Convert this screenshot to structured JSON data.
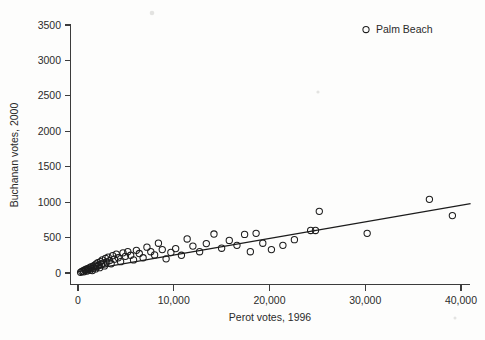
{
  "chart_data": {
    "type": "scatter",
    "title": "",
    "xlabel": "Perot votes, 1996",
    "ylabel": "Buchanan votes, 2000",
    "xlim": [
      -1500,
      42000
    ],
    "ylim": [
      -140,
      3650
    ],
    "xticks": [
      0,
      10000,
      20000,
      30000,
      40000
    ],
    "xticklabels": [
      "0",
      "10,000",
      "20,000",
      "30,000",
      "40,000"
    ],
    "yticks": [
      0,
      500,
      1000,
      1500,
      2000,
      2500,
      3000,
      3500
    ],
    "yticklabels": [
      "0",
      "500",
      "1000",
      "1500",
      "2000",
      "2500",
      "3000",
      "3500"
    ],
    "grid": false,
    "legend_position": "top-right",
    "legend": [
      {
        "label": "Palm Beach",
        "marker": "open-circle"
      }
    ],
    "marker_style": "open-circle",
    "series": [
      {
        "name": "Florida counties",
        "marker": "open-circle",
        "points": [
          [
            270,
            9
          ],
          [
            400,
            22
          ],
          [
            520,
            30
          ],
          [
            610,
            18
          ],
          [
            700,
            45
          ],
          [
            790,
            38
          ],
          [
            860,
            55
          ],
          [
            940,
            28
          ],
          [
            1010,
            60
          ],
          [
            1100,
            48
          ],
          [
            1180,
            72
          ],
          [
            1260,
            40
          ],
          [
            1340,
            85
          ],
          [
            1420,
            62
          ],
          [
            1500,
            35
          ],
          [
            1580,
            95
          ],
          [
            1660,
            70
          ],
          [
            1750,
            110
          ],
          [
            1830,
            58
          ],
          [
            1910,
            128
          ],
          [
            2000,
            90
          ],
          [
            2080,
            145
          ],
          [
            2170,
            105
          ],
          [
            2260,
            75
          ],
          [
            2350,
            160
          ],
          [
            2450,
            120
          ],
          [
            2540,
            185
          ],
          [
            2640,
            140
          ],
          [
            2760,
            100
          ],
          [
            2880,
            205
          ],
          [
            3000,
            155
          ],
          [
            3150,
            225
          ],
          [
            3300,
            175
          ],
          [
            3460,
            130
          ],
          [
            3620,
            245
          ],
          [
            3800,
            195
          ],
          [
            4000,
            265
          ],
          [
            4200,
            215
          ],
          [
            4450,
            160
          ],
          [
            4700,
            285
          ],
          [
            4950,
            235
          ],
          [
            5200,
            300
          ],
          [
            5500,
            250
          ],
          [
            5800,
            185
          ],
          [
            6100,
            320
          ],
          [
            6400,
            275
          ],
          [
            6800,
            215
          ],
          [
            7200,
            365
          ],
          [
            7600,
            300
          ],
          [
            8000,
            255
          ],
          [
            8400,
            420
          ],
          [
            8800,
            330
          ],
          [
            9200,
            200
          ],
          [
            9700,
            290
          ],
          [
            10200,
            345
          ],
          [
            10800,
            250
          ],
          [
            11400,
            480
          ],
          [
            12000,
            380
          ],
          [
            12700,
            300
          ],
          [
            13400,
            415
          ],
          [
            14200,
            550
          ],
          [
            15000,
            350
          ],
          [
            15800,
            460
          ],
          [
            16600,
            390
          ],
          [
            17400,
            545
          ],
          [
            18000,
            300
          ],
          [
            18600,
            560
          ],
          [
            19300,
            420
          ],
          [
            20200,
            330
          ],
          [
            21400,
            390
          ],
          [
            22600,
            470
          ],
          [
            24300,
            600
          ],
          [
            24800,
            600
          ],
          [
            25200,
            870
          ],
          [
            30200,
            560
          ],
          [
            36700,
            1040
          ],
          [
            39100,
            810
          ]
        ]
      }
    ],
    "fit_line": {
      "type": "linear-regression",
      "x_start": 0,
      "y_start": 20,
      "x_end": 41000,
      "y_end": 980
    },
    "highlight": {
      "label": "Palm Beach",
      "note": "legend entry only"
    }
  }
}
